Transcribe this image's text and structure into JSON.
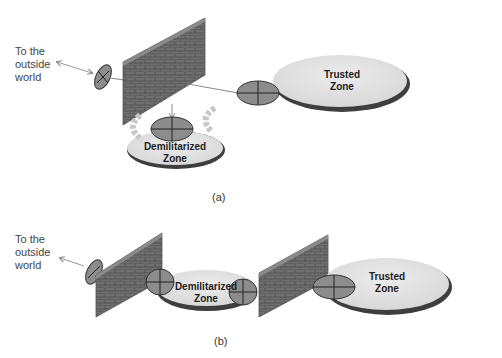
{
  "diagram_a": {
    "outside_label_lines": [
      "To the",
      "outside",
      "world"
    ],
    "trusted_zone": [
      "Trusted",
      "Zone"
    ],
    "dmz": [
      "Demilitarized",
      "Zone"
    ],
    "caption": "(a)"
  },
  "diagram_b": {
    "outside_label_lines": [
      "To the",
      "outside",
      "world"
    ],
    "trusted_zone": [
      "Trusted",
      "Zone"
    ],
    "dmz": [
      "Demilitarized",
      "Zone"
    ],
    "caption": "(b)"
  },
  "colors": {
    "wall": "#6e6e6e",
    "wall_top": "#8a8a8a",
    "router_fill": "#8c8c8c",
    "zone_fill": "#e4e4e4",
    "zone_shadow": "#4a4a4a",
    "arrow": "#bbbbbb"
  }
}
